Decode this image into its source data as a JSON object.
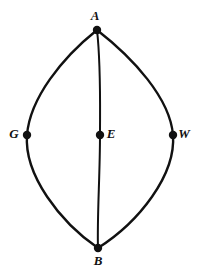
{
  "figure": {
    "background_color": "#ffffff",
    "stroke_color": "#111111",
    "dot_color": "#111111",
    "label_color": "#111111",
    "canvas": {
      "width": 207,
      "height": 276
    }
  },
  "chart_data": {
    "type": "diagram",
    "title": "",
    "xlabel": "",
    "ylabel": "",
    "grid": false,
    "legend": "none",
    "xlim": [
      0,
      207
    ],
    "ylim": [
      0,
      276
    ],
    "points": [
      {
        "label": "A",
        "x": 97,
        "y": 30,
        "label_dx": -2,
        "label_dy": -13,
        "dot_radius": 4.2
      },
      {
        "label": "G",
        "x": 27,
        "y": 135,
        "label_dx": -13,
        "label_dy": 0,
        "dot_radius": 4.2
      },
      {
        "label": "E",
        "x": 100,
        "y": 135,
        "label_dx": 11,
        "label_dy": 0,
        "dot_radius": 4.2
      },
      {
        "label": "W",
        "x": 173,
        "y": 135,
        "label_dx": 11,
        "label_dy": 0,
        "dot_radius": 4.2
      },
      {
        "label": "B",
        "x": 98,
        "y": 248,
        "label_dx": 0,
        "label_dy": 14,
        "dot_radius": 4.2
      }
    ],
    "arcs": [
      {
        "name": "left-arc",
        "from": "A",
        "through": "G",
        "to": "B",
        "path": "M 97 30 C 62 58, 30 98, 27 135 C 24 175, 60 222, 98 248",
        "stroke_width": 2.4
      },
      {
        "name": "right-arc",
        "from": "A",
        "through": "W",
        "to": "B",
        "path": "M 97 30 C 133 58, 170 98, 173 135 C 176 175, 139 222, 98 248",
        "stroke_width": 2.4
      },
      {
        "name": "middle-arc",
        "from": "A",
        "through": "E",
        "to": "B",
        "path": "M 97 30 C 101 65, 100 105, 100 135 C 100 175, 97 218, 98 248",
        "stroke_width": 2.0
      }
    ]
  }
}
